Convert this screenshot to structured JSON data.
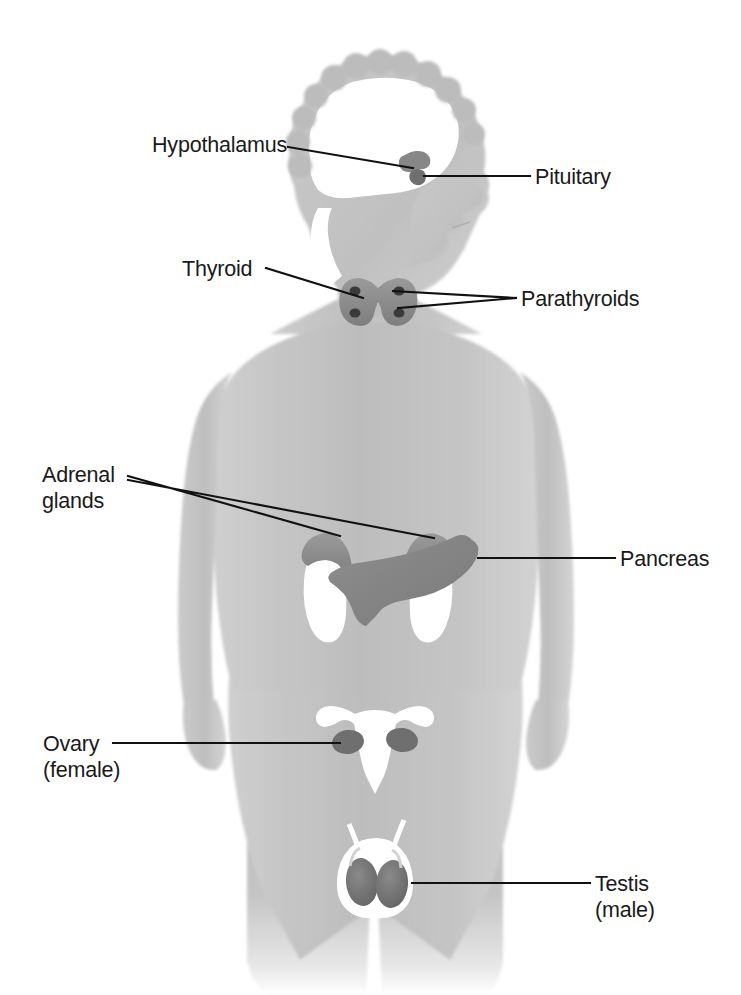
{
  "figure": {
    "background_color": "#ffffff",
    "line_color": "#111111",
    "text_color": "#1a1a1a",
    "body_fill_light": "#d9d9d9",
    "body_fill_mid": "#c2c2c2",
    "body_fill_dark": "#a8a8a8",
    "organ_fill_dark": "#8c8c8c",
    "organ_fill_white": "#ffffff"
  },
  "labels": [
    {
      "id": "hypothalamus",
      "lines": [
        "Hypothalamus"
      ],
      "text_x": 152,
      "text_y": 152,
      "anchor": "start",
      "leader": "M 288,147 L 413,168"
    },
    {
      "id": "pituitary",
      "lines": [
        "Pituitary"
      ],
      "text_x": 535,
      "text_y": 184,
      "anchor": "start",
      "leader": "M 424,176 L 530,176"
    },
    {
      "id": "thyroid",
      "lines": [
        "Thyroid"
      ],
      "text_x": 182,
      "text_y": 276,
      "anchor": "start",
      "leader": "M 266,268 L 363,298"
    },
    {
      "id": "parathyroids",
      "lines": [
        "Parathyroids"
      ],
      "text_x": 521,
      "text_y": 306,
      "anchor": "start",
      "leader": "M 393,291 L 516,298 M 398,308 L 516,298"
    },
    {
      "id": "adrenal-glands",
      "lines": [
        "Adrenal",
        "glands"
      ],
      "text_x": 42,
      "text_y": 482,
      "anchor": "start",
      "leader": "M 128,476 L 340,536 M 128,480 L 434,538"
    },
    {
      "id": "pancreas",
      "lines": [
        "Pancreas"
      ],
      "text_x": 620,
      "text_y": 566,
      "anchor": "start",
      "leader": "M 478,558 L 615,558"
    },
    {
      "id": "ovary-female",
      "lines": [
        "Ovary",
        "(female)"
      ],
      "text_x": 43,
      "text_y": 751,
      "anchor": "start",
      "leader": "M 113,743 L 340,743"
    },
    {
      "id": "testis-male",
      "lines": [
        "Testis",
        "(male)"
      ],
      "text_x": 595,
      "text_y": 891,
      "anchor": "start",
      "leader": "M 412,883 L 590,883"
    }
  ],
  "organs": [
    {
      "id": "brain-cavity",
      "name": "brain"
    },
    {
      "id": "hypothalamus-gland",
      "name": "hypothalamus"
    },
    {
      "id": "pituitary-gland",
      "name": "pituitary"
    },
    {
      "id": "thyroid-gland",
      "name": "thyroid"
    },
    {
      "id": "parathyroid-glands",
      "name": "parathyroids"
    },
    {
      "id": "adrenal-gland-left",
      "name": "adrenal gland"
    },
    {
      "id": "adrenal-gland-right",
      "name": "adrenal gland"
    },
    {
      "id": "kidney-left",
      "name": "kidney"
    },
    {
      "id": "kidney-right",
      "name": "kidney"
    },
    {
      "id": "pancreas-organ",
      "name": "pancreas"
    },
    {
      "id": "uterus",
      "name": "uterus"
    },
    {
      "id": "ovary-left",
      "name": "ovary"
    },
    {
      "id": "ovary-right",
      "name": "ovary"
    },
    {
      "id": "scrotum",
      "name": "scrotum"
    },
    {
      "id": "testis-left",
      "name": "testis"
    },
    {
      "id": "testis-right",
      "name": "testis"
    }
  ]
}
